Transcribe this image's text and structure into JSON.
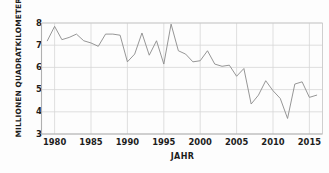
{
  "chart_data": {
    "type": "line",
    "title": "",
    "xlabel": "JAHR",
    "ylabel": "MILLIONEN QUADRATKILOMETER",
    "xlim": [
      1978.2,
      1916.8
    ],
    "x_range": [
      1978.2,
      1916.8
    ],
    "ylim": [
      3,
      8
    ],
    "grid": true,
    "legend": "none",
    "line_color": "#8a8a8a",
    "x_ticks": [
      1980,
      1985,
      1990,
      1995,
      2000,
      2005,
      2010,
      2015
    ],
    "y_ticks": [
      3,
      4,
      5,
      6,
      7,
      8
    ],
    "x": [
      1979,
      1980,
      1981,
      1982,
      1983,
      1984,
      1985,
      1986,
      1987,
      1988,
      1989,
      1990,
      1991,
      1992,
      1993,
      1994,
      1995,
      1996,
      1997,
      1998,
      1999,
      2000,
      2001,
      2002,
      2003,
      2004,
      2005,
      2006,
      2007,
      2008,
      2009,
      2010,
      2011,
      2012,
      2013,
      2014,
      2015,
      2016
    ],
    "values": [
      7.2,
      7.85,
      7.25,
      7.35,
      7.5,
      7.2,
      7.1,
      6.95,
      7.5,
      7.5,
      7.45,
      6.25,
      6.6,
      7.55,
      6.55,
      7.2,
      6.15,
      7.95,
      6.75,
      6.6,
      6.25,
      6.3,
      6.75,
      6.15,
      6.05,
      6.1,
      5.6,
      5.95,
      4.35,
      4.75,
      5.4,
      4.95,
      4.6,
      3.7,
      5.25,
      5.35,
      4.65,
      4.75
    ],
    "units": "Millionen Quadratkilometer"
  },
  "axes": {
    "y_title": "MILLIONEN QUADRATKILOMETER",
    "x_title": "JAHR"
  }
}
